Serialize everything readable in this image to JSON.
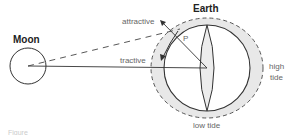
{
  "diagram": {
    "moon": {
      "label": "Moon"
    },
    "earth": {
      "label": "Earth"
    },
    "point": {
      "label": "P"
    },
    "forces": {
      "attractive": "attractive",
      "tractive": "tractive"
    },
    "tides": {
      "high": [
        "high",
        "tide"
      ],
      "low": "low tide"
    },
    "caption": "Figure"
  },
  "colors": {
    "line": "#333333",
    "tide_bulge": "#e6e6e6",
    "label": "#666666"
  }
}
